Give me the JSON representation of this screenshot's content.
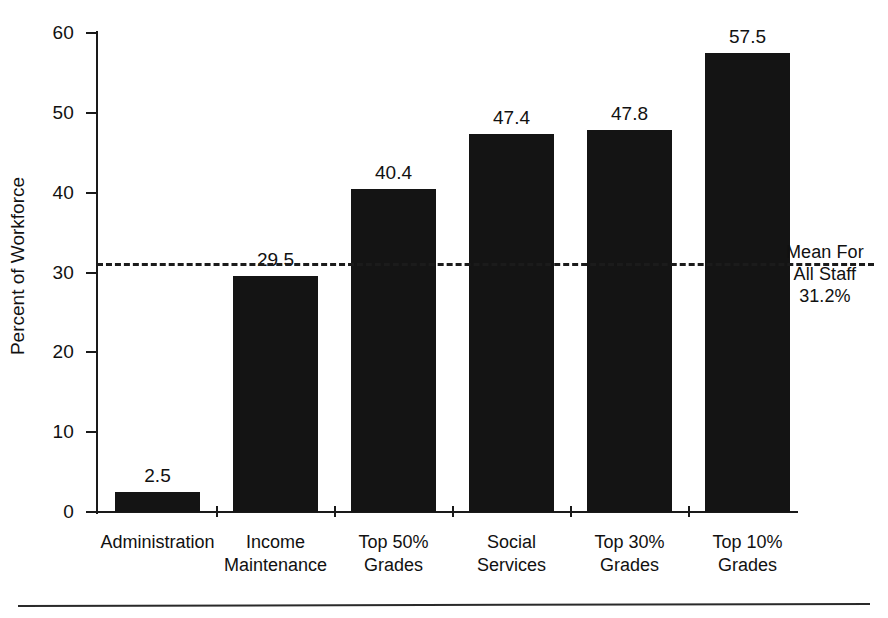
{
  "chart_data": {
    "type": "bar",
    "title": "",
    "xlabel": "",
    "ylabel": "Percent of Workforce",
    "ylim": [
      0,
      60
    ],
    "yticks": [
      0,
      10,
      20,
      30,
      40,
      50,
      60
    ],
    "ytick_labels": [
      "0",
      "10",
      "20",
      "30",
      "40",
      "50",
      "60"
    ],
    "grid": false,
    "legend": "none",
    "bar_color": "#141414",
    "categories": [
      "Administration",
      "Income\nMaintenance",
      "Top 50%\nGrades",
      "Social\nServices",
      "Top 30%\nGrades",
      "Top 10%\nGrades"
    ],
    "category_lines": [
      [
        "Administration"
      ],
      [
        "Income",
        "Maintenance"
      ],
      [
        "Top 50%",
        "Grades"
      ],
      [
        "Social",
        "Services"
      ],
      [
        "Top 30%",
        "Grades"
      ],
      [
        "Top 10%",
        "Grades"
      ]
    ],
    "values": [
      2.5,
      29.5,
      40.4,
      47.4,
      47.8,
      57.5
    ],
    "value_labels": [
      "2.5",
      "29.5",
      "40.4",
      "47.4",
      "47.8",
      "57.5"
    ],
    "reference_line": {
      "value": 31.2,
      "style": "dashed",
      "label_lines": [
        "Mean For",
        "All Staff",
        "31.2%"
      ],
      "label_line1": "Mean For",
      "label_line2": "All Staff",
      "label_line3": "31.2%"
    }
  }
}
